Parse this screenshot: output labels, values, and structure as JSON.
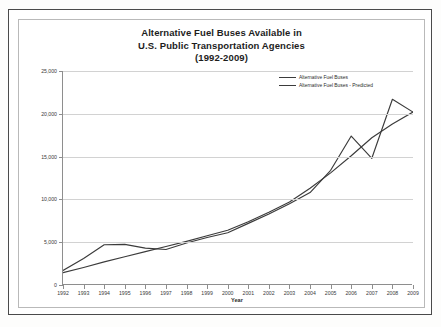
{
  "document": {
    "title_lines": [
      "Alternative Fuel Buses Available in",
      "U.S. Public Transportation Agencies",
      "(1992-2009)"
    ]
  },
  "chart_data": {
    "type": "line",
    "title": "Alternative Fuel Buses Available in U.S. Public Transportation Agencies (1992-2009)",
    "xlabel": "Year",
    "ylabel": "Estimated Number of Alternative Fuel Buses",
    "x": [
      1992,
      1993,
      1994,
      1995,
      1996,
      1997,
      1998,
      1999,
      2000,
      2001,
      2002,
      2003,
      2004,
      2005,
      2006,
      2007,
      2008,
      2009
    ],
    "xtick_labels": [
      "1992",
      "1993",
      "1994",
      "1995",
      "1996",
      "1997",
      "1998",
      "1999",
      "2000",
      "2001",
      "2002",
      "2003",
      "2004",
      "2005",
      "2006",
      "2007",
      "2008",
      "2009"
    ],
    "ytick_labels": [
      "0",
      "5,000",
      "10,000",
      "15,000",
      "20,000",
      "25,000"
    ],
    "ytick_values": [
      0,
      5000,
      10000,
      15000,
      20000,
      25000
    ],
    "xlim": [
      1992,
      2009
    ],
    "ylim": [
      0,
      25000
    ],
    "grid": true,
    "legend_position": "top-right",
    "series": [
      {
        "name": "Alternative Fuel Buses",
        "color": "#3b3b3b",
        "values": [
          1700,
          3100,
          4700,
          4750,
          4300,
          4150,
          4900,
          5550,
          6100,
          7200,
          8300,
          9500,
          10800,
          13400,
          17400,
          14800,
          21700,
          20200
        ]
      },
      {
        "name": "Alternative Fuel Buses - Predicted",
        "color": "#3b3b3b",
        "values": [
          1450,
          2050,
          2700,
          3300,
          3900,
          4500,
          5100,
          5750,
          6400,
          7400,
          8500,
          9700,
          11300,
          13100,
          15100,
          17200,
          18800,
          20200
        ]
      }
    ]
  },
  "axis": {
    "y_title": "Estimated Number of Alternative Fuel Buses",
    "x_title": "Year"
  }
}
